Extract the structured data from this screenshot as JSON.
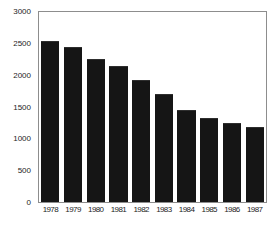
{
  "chart_data": {
    "type": "bar",
    "title": "",
    "xlabel": "",
    "ylabel": "",
    "categories": [
      "1978",
      "1979",
      "1980",
      "1981",
      "1982",
      "1983",
      "1984",
      "1985",
      "1986",
      "1987"
    ],
    "values": [
      2545,
      2450,
      2255,
      2140,
      1920,
      1700,
      1445,
      1325,
      1250,
      1180
    ],
    "ylim": [
      0,
      3000
    ],
    "yticks": [
      0,
      500,
      1000,
      1500,
      2000,
      2500,
      3000
    ],
    "ytick_labels": [
      "0",
      "500",
      "1000",
      "1500",
      "2000",
      "2500",
      "3000"
    ],
    "yticks_minor": [
      250,
      750,
      1250,
      1750,
      2250,
      2750
    ],
    "grid": false,
    "legend": null,
    "bar_color": "#151515",
    "axis_color": "#8d8d8d",
    "background": "#ffffff"
  },
  "figure": {
    "title_visible_fragment": "",
    "title_clipped": true
  }
}
